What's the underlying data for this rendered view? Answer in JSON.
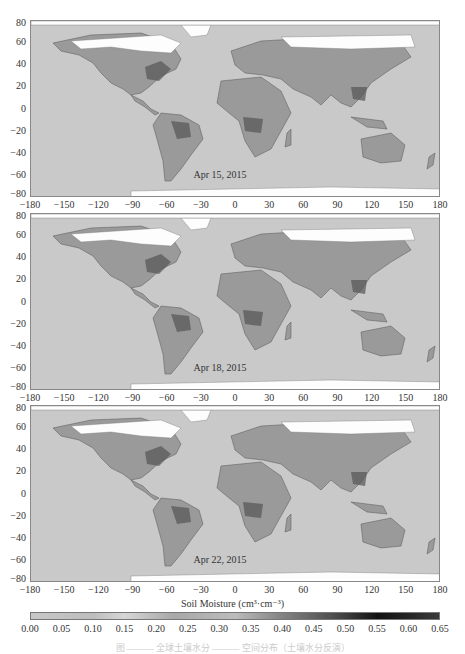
{
  "chart_data": [
    {
      "type": "heatmap",
      "title": "Apr 15, 2015",
      "subject": "Global soil moisture map",
      "xlabel": "",
      "ylabel": "",
      "xlim": [
        -180,
        180
      ],
      "ylim": [
        -80,
        80
      ],
      "xticks": [
        -180,
        -150,
        -120,
        -90,
        -60,
        -30,
        0,
        30,
        60,
        90,
        120,
        150,
        180
      ],
      "yticks": [
        80,
        60,
        40,
        20,
        0,
        -20,
        -40,
        -60,
        -80
      ]
    },
    {
      "type": "heatmap",
      "title": "Apr 18, 2015",
      "subject": "Global soil moisture map",
      "xlim": [
        -180,
        180
      ],
      "ylim": [
        -80,
        80
      ],
      "xticks": [
        -180,
        -150,
        -120,
        -90,
        -60,
        -30,
        0,
        30,
        60,
        90,
        120,
        150,
        180
      ],
      "yticks": [
        80,
        60,
        40,
        20,
        0,
        -20,
        -40,
        -60,
        -80
      ]
    },
    {
      "type": "heatmap",
      "title": "Apr 22, 2015",
      "subject": "Global soil moisture map",
      "xlim": [
        -180,
        180
      ],
      "ylim": [
        -80,
        80
      ],
      "xticks": [
        -180,
        -150,
        -120,
        -90,
        -60,
        -30,
        0,
        30,
        60,
        90,
        120,
        150,
        180
      ],
      "yticks": [
        80,
        60,
        40,
        20,
        0,
        -20,
        -40,
        -60,
        -80
      ]
    }
  ],
  "panels": [
    {
      "date": "Apr 15, 2015"
    },
    {
      "date": "Apr 18, 2015"
    },
    {
      "date": "Apr 22, 2015"
    }
  ],
  "xticks": [
    "−180",
    "−150",
    "−120",
    "−90",
    "−60",
    "−30",
    "0",
    "30",
    "60",
    "90",
    "120",
    "150",
    "180"
  ],
  "yticks": [
    "80",
    "60",
    "40",
    "20",
    "0",
    "−20",
    "−40",
    "−60",
    "−80"
  ],
  "colorbar": {
    "title": "Soil Moisture (cm³·cm⁻³)",
    "ticks": [
      "0.00",
      "0.05",
      "0.10",
      "0.15",
      "0.20",
      "0.25",
      "0.30",
      "0.35",
      "0.40",
      "0.45",
      "0.50",
      "0.55",
      "0.60",
      "0.65"
    ],
    "range": [
      0,
      0.65
    ]
  },
  "caption": "图 ——— 全球土壤水分 ——— 空间分布（土壤水分反演）"
}
